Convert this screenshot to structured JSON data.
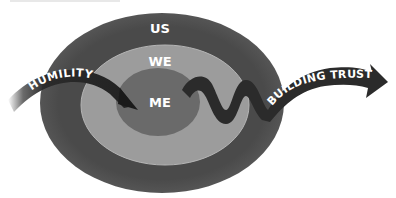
{
  "diagram": {
    "rings": [
      {
        "id": "outer",
        "label": "US",
        "color": "#4a4a4a"
      },
      {
        "id": "middle",
        "label": "WE",
        "color": "#9c9c9c"
      },
      {
        "id": "inner",
        "label": "ME",
        "color": "#6a6a6a"
      }
    ],
    "arrows": [
      {
        "id": "humility",
        "label": "HUMILITY",
        "color": "#2b2b2b"
      },
      {
        "id": "building-trust",
        "label": "BUILDING TRUST",
        "color": "#2b2b2b"
      }
    ]
  }
}
